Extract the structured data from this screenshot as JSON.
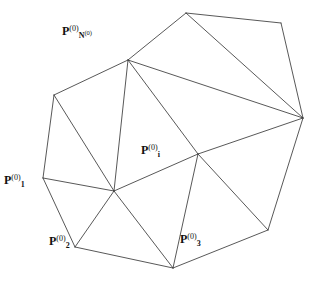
{
  "figure": {
    "type": "geometric-diagram",
    "background_color": "#ffffff",
    "line_color": "#3a3a3a",
    "label_color": "#111111",
    "canvas": {
      "width": 313,
      "height": 284
    }
  },
  "vertices": [
    {
      "id": "v_top",
      "x": 186,
      "y": 13,
      "labelled": false
    },
    {
      "id": "v_topright",
      "x": 281,
      "y": 23,
      "labelled": false
    },
    {
      "id": "v_N",
      "x": 128,
      "y": 60,
      "labelled": true
    },
    {
      "id": "v_upperleft",
      "x": 54,
      "y": 95,
      "labelled": false
    },
    {
      "id": "v_right",
      "x": 303,
      "y": 118,
      "labelled": false
    },
    {
      "id": "v_i",
      "x": 198,
      "y": 154,
      "labelled": true
    },
    {
      "id": "v_1",
      "x": 43,
      "y": 178,
      "labelled": true
    },
    {
      "id": "v_hub",
      "x": 114,
      "y": 191,
      "labelled": false
    },
    {
      "id": "v_bottomright",
      "x": 268,
      "y": 230,
      "labelled": false
    },
    {
      "id": "v_2",
      "x": 75,
      "y": 247,
      "labelled": true
    },
    {
      "id": "v_3",
      "x": 173,
      "y": 268,
      "labelled": true
    }
  ],
  "edges": [
    [
      "v_top",
      "v_topright"
    ],
    [
      "v_top",
      "v_N"
    ],
    [
      "v_top",
      "v_right"
    ],
    [
      "v_topright",
      "v_right"
    ],
    [
      "v_N",
      "v_upperleft"
    ],
    [
      "v_N",
      "v_right"
    ],
    [
      "v_N",
      "v_i"
    ],
    [
      "v_N",
      "v_hub"
    ],
    [
      "v_upperleft",
      "v_1"
    ],
    [
      "v_upperleft",
      "v_hub"
    ],
    [
      "v_right",
      "v_i"
    ],
    [
      "v_right",
      "v_bottomright"
    ],
    [
      "v_i",
      "v_hub"
    ],
    [
      "v_i",
      "v_3"
    ],
    [
      "v_i",
      "v_bottomright"
    ],
    [
      "v_1",
      "v_hub"
    ],
    [
      "v_1",
      "v_2"
    ],
    [
      "v_hub",
      "v_2"
    ],
    [
      "v_hub",
      "v_3"
    ],
    [
      "v_2",
      "v_3"
    ],
    [
      "v_3",
      "v_bottomright"
    ]
  ],
  "labels": {
    "p_n": {
      "base": "P",
      "superscript": "(0)",
      "subscript_base": "N",
      "subscript_superscript": "(0)",
      "text": "P_N^(0)^(0)",
      "x": 62,
      "y": 25
    },
    "p_i": {
      "base": "P",
      "superscript": "(0)",
      "subscript_base": "i",
      "subscript_superscript": "",
      "text": "P_i^(0)",
      "x": 141,
      "y": 144
    },
    "p_1": {
      "base": "P",
      "superscript": "(0)",
      "subscript_base": "1",
      "subscript_superscript": "",
      "text": "P_1^(0)",
      "x": 4,
      "y": 174
    },
    "p_2": {
      "base": "P",
      "superscript": "(0)",
      "subscript_base": "2",
      "subscript_superscript": "",
      "text": "P_2^(0)",
      "x": 49,
      "y": 235
    },
    "p_3": {
      "base": "P",
      "superscript": "(0)",
      "subscript_base": "3",
      "subscript_superscript": "",
      "text": "P_3^(0)",
      "x": 180,
      "y": 233
    }
  }
}
